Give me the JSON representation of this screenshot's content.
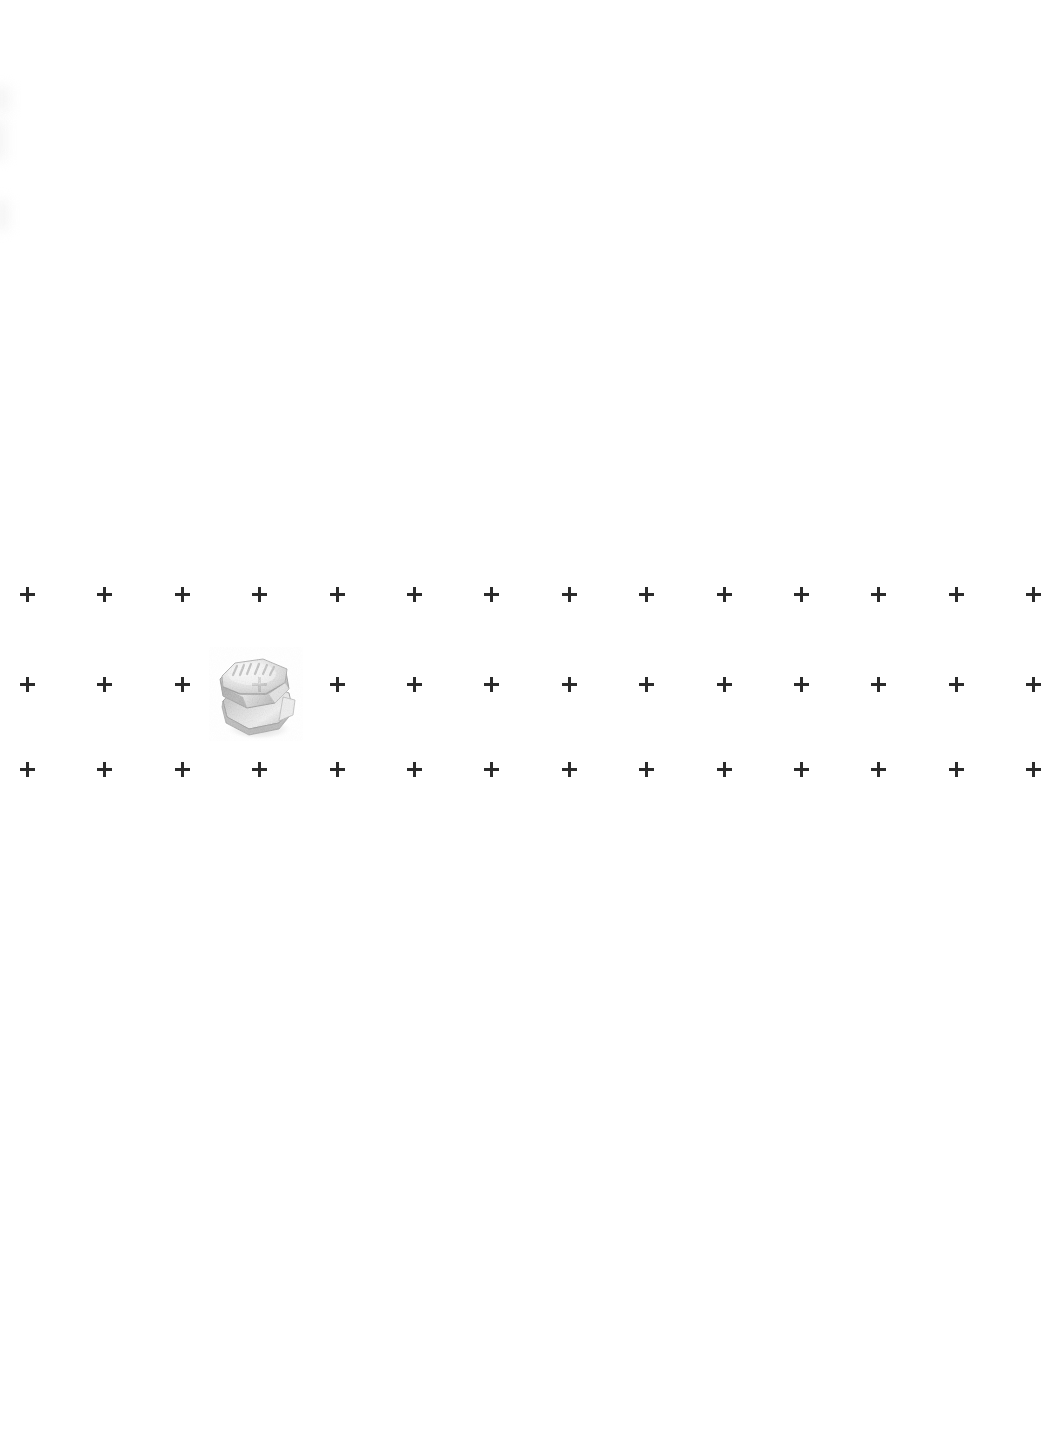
{
  "page": {
    "background_color": "#ffffff",
    "width": 1042,
    "height": 1440,
    "visible_text": ""
  },
  "grid": {
    "name": "fiducial-cross-grid",
    "mark_glyph": "+",
    "mark_color": "#2b2b2b",
    "mark_size_px": 15,
    "mark_stroke_px": 3,
    "columns": 14,
    "rows": 3,
    "x_start": 20,
    "x_spacing": 77.4,
    "row_y": [
      587,
      677,
      762
    ],
    "clipped_last_column": true
  },
  "object": {
    "name": "hex-flange-bolt",
    "label": "",
    "left": 209,
    "top": 645,
    "width": 94,
    "height": 96,
    "colors": {
      "highlight": "#fbfbfb",
      "light": "#e2e2e2",
      "mid": "#c9c9c9",
      "shade": "#b0b0b0",
      "dark": "#9a9a9a",
      "edge": "#8c8c8c",
      "shadow": "#d8d8d8"
    },
    "top_face_marking": "embossed tick marks"
  },
  "artifacts": {
    "left_margin_smudges": 3,
    "smudge_color": "#f4f4f4"
  }
}
